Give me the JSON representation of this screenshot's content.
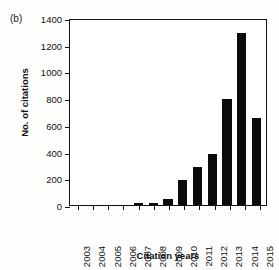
{
  "figure": {
    "panel_label": "(b)"
  },
  "chart_data": {
    "type": "bar",
    "title": "",
    "subtitle": "",
    "xlabel": "Citation years",
    "ylabel": "No. of citations",
    "categories": [
      "2003",
      "2004",
      "2005",
      "2006",
      "2007",
      "2008",
      "2009",
      "2010",
      "2011",
      "2012",
      "2013",
      "2014",
      "2015"
    ],
    "values": [
      0,
      2,
      0,
      1,
      12,
      15,
      48,
      188,
      288,
      380,
      795,
      1290,
      655
    ],
    "series": [
      {
        "name": "No. of citations",
        "values": [
          0,
          2,
          0,
          1,
          12,
          15,
          48,
          188,
          288,
          380,
          795,
          1290,
          655
        ]
      }
    ],
    "ylim": [
      0,
      1400
    ],
    "xlim_categories": 13,
    "yticks": [
      0,
      200,
      400,
      600,
      800,
      1000,
      1200,
      1400
    ],
    "ytick_labels": [
      "0",
      "200",
      "400",
      "600",
      "800",
      "1000",
      "1200",
      "1400"
    ],
    "grid": false,
    "legend": null,
    "legend_position": "none",
    "bar_color": "#0b0b0b",
    "axis_color": "#111111",
    "background_color": "#ffffff",
    "annotations": [
      "(b)"
    ]
  }
}
